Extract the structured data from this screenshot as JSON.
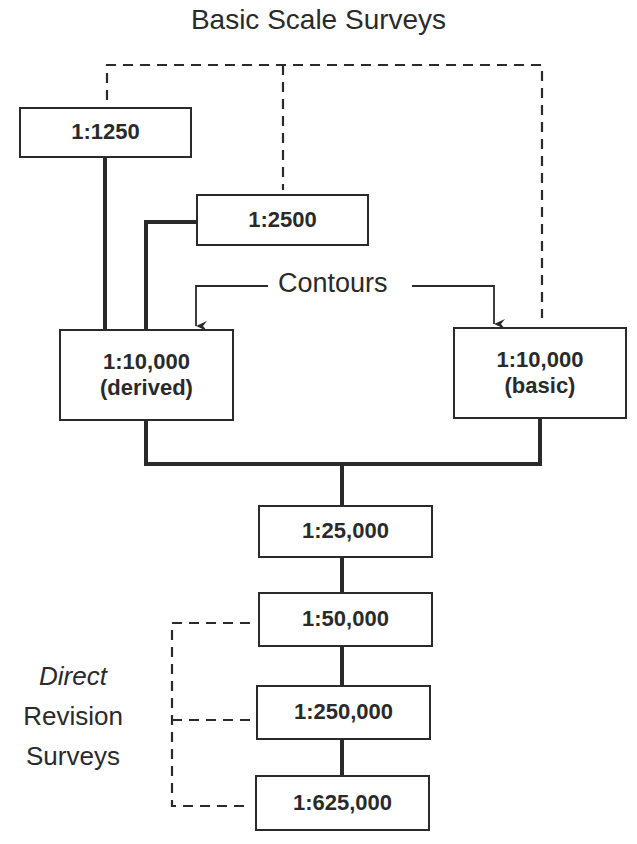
{
  "title": "Basic Scale Surveys",
  "contours_label": "Contours",
  "boxes": {
    "s1250": {
      "scale": "1:1250"
    },
    "s2500": {
      "scale": "1:2500"
    },
    "s10000_derived": {
      "scale": "1:10,000",
      "note": "(derived)"
    },
    "s10000_basic": {
      "scale": "1:10,000",
      "note": "(basic)"
    },
    "s25000": {
      "scale": "1:25,000"
    },
    "s50000": {
      "scale": "1:50,000"
    },
    "s250000": {
      "scale": "1:250,000"
    },
    "s625000": {
      "scale": "1:625,000"
    }
  },
  "side_label": {
    "line1": "Direct",
    "line2": "Revision",
    "line3": "Surveys"
  },
  "colors": {
    "ink": "#2a2a2a",
    "background": "#ffffff"
  }
}
